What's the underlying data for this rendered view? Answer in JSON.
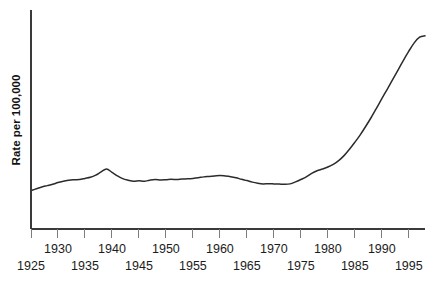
{
  "chart_data": {
    "type": "line",
    "title": "",
    "subtitle": "",
    "xlabel": "",
    "ylabel": "Rate per 100,000",
    "legend": [],
    "legend_position": "none",
    "grid": false,
    "xlim": [
      1925,
      1998
    ],
    "ylim": [
      0,
      100
    ],
    "y_axis_ticks_visible": false,
    "x_tick_labels_upper": [
      "1930",
      "1940",
      "1950",
      "1960",
      "1970",
      "1980",
      "1990"
    ],
    "x_tick_labels_lower": [
      "1925",
      "1935",
      "1945",
      "1955",
      "1965",
      "1975",
      "1985",
      "1995"
    ],
    "x_tick_values": [
      1925,
      1930,
      1935,
      1940,
      1945,
      1950,
      1955,
      1960,
      1965,
      1970,
      1975,
      1980,
      1985,
      1990,
      1995
    ],
    "x": [
      1925,
      1926,
      1927,
      1928,
      1929,
      1930,
      1931,
      1932,
      1933,
      1934,
      1935,
      1936,
      1937,
      1938,
      1939,
      1940,
      1941,
      1942,
      1943,
      1944,
      1945,
      1946,
      1947,
      1948,
      1949,
      1950,
      1951,
      1952,
      1953,
      1954,
      1955,
      1956,
      1957,
      1958,
      1959,
      1960,
      1961,
      1962,
      1963,
      1964,
      1965,
      1966,
      1967,
      1968,
      1969,
      1970,
      1971,
      1972,
      1973,
      1974,
      1975,
      1976,
      1977,
      1978,
      1979,
      1980,
      1981,
      1982,
      1983,
      1984,
      1985,
      1986,
      1987,
      1988,
      1989,
      1990,
      1991,
      1992,
      1993,
      1994,
      1995,
      1996,
      1997,
      1998
    ],
    "values": [
      17.5,
      18.4,
      19.2,
      19.8,
      20.4,
      21.2,
      21.8,
      22.3,
      22.5,
      22.6,
      23.1,
      23.6,
      24.6,
      26.1,
      27.4,
      25.9,
      24.3,
      23.0,
      22.3,
      21.8,
      22.0,
      21.8,
      22.3,
      22.6,
      22.4,
      22.5,
      22.7,
      22.6,
      22.8,
      22.9,
      23.1,
      23.4,
      23.8,
      24.0,
      24.2,
      24.4,
      24.2,
      23.9,
      23.4,
      22.7,
      22.1,
      21.4,
      20.9,
      20.6,
      20.7,
      20.6,
      20.5,
      20.4,
      20.6,
      21.5,
      22.6,
      23.8,
      25.4,
      26.6,
      27.4,
      28.3,
      29.5,
      31.2,
      33.5,
      36.4,
      39.6,
      43.0,
      46.8,
      50.8,
      55.1,
      59.5,
      63.8,
      68.2,
      72.6,
      77.0,
      81.2,
      85.0,
      87.6,
      88.2
    ],
    "line_color": "#2b2b2b",
    "axis_color": "#3a3a3a",
    "tick_color": "#7d7d7d",
    "background_color": "#ffffff"
  }
}
